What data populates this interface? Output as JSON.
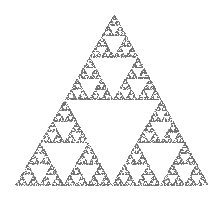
{
  "figure": {
    "subject": "Sierpinski triangle",
    "render_style": "stippled chaos-game point cloud",
    "background": "#ffffff",
    "point_color": "#6e6e6e",
    "vertices": [
      [
        114,
        14
      ],
      [
        15,
        185
      ],
      [
        208,
        185
      ]
    ],
    "iterations": 6,
    "points": 22000
  }
}
